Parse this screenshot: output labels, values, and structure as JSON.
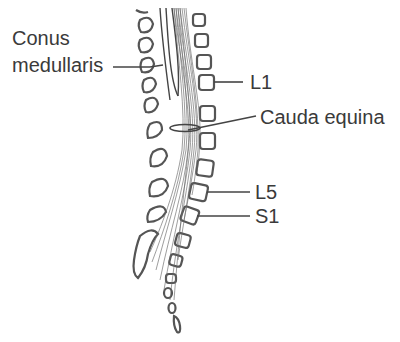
{
  "diagram": {
    "type": "anatomical-illustration",
    "labels": {
      "conus_line1": "Conus",
      "conus_line2": "medullaris",
      "l1": "L1",
      "cauda_equina": "Cauda equina",
      "l5": "L5",
      "s1": "S1"
    },
    "colors": {
      "background": "#ffffff",
      "ink": "#3a3a3a",
      "outline": "#555555"
    }
  }
}
